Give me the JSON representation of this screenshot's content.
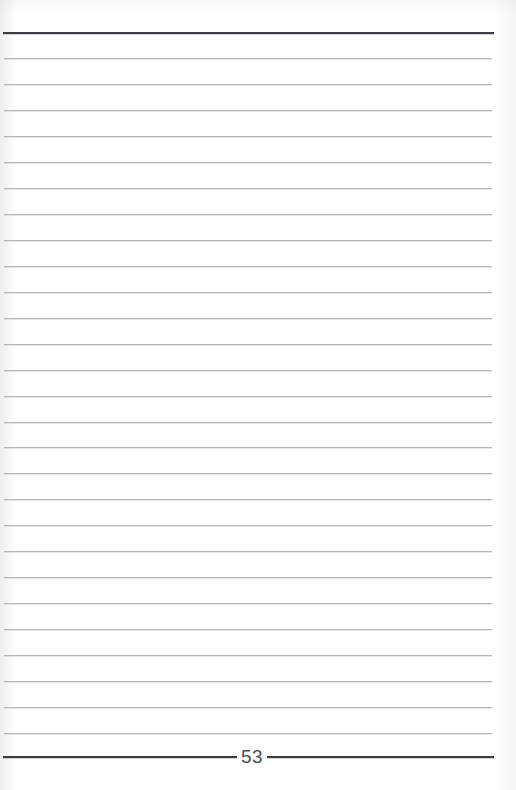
{
  "document": {
    "kind": "scanned-lined-notebook-page",
    "page_number": "53",
    "page_width": 516,
    "page_height": 790,
    "background_color": "#ffffff"
  },
  "rules": {
    "header_rule": {
      "name": "header-rule",
      "y": 32,
      "x_start": 3,
      "x_end": 494,
      "color": "#3c3c42",
      "thickness": 2
    },
    "footer_rule": {
      "name": "footer-rule",
      "y": 756,
      "x_start": 3,
      "x_end": 494,
      "color": "#3c3c42",
      "thickness": 2
    },
    "body_rule_color": "#b5b5ba",
    "body_rule_thickness": 1,
    "body_rule_x_start": 4,
    "body_rule_x_end": 492,
    "line_spacing": 25.9,
    "body_rule_y_positions": [
      58,
      84,
      110,
      136,
      162,
      188,
      214,
      240,
      266,
      292,
      318,
      344,
      370,
      396,
      422,
      447,
      473,
      499,
      525,
      551,
      577,
      603,
      629,
      655,
      681,
      707,
      733
    ]
  },
  "page_number_label": {
    "text": "53",
    "x_center": 252,
    "y_center": 757,
    "color": "#4a4a51"
  }
}
